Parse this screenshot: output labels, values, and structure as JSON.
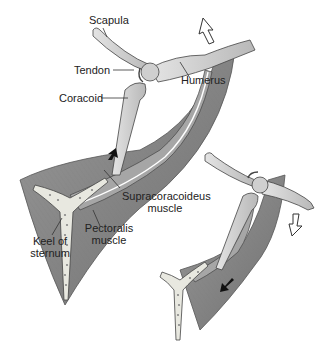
{
  "figure": {
    "panels": [
      {
        "id": "upstroke",
        "arrow_direction": "up",
        "labels": {
          "scapula": "Scapula",
          "tendon": "Tendon",
          "humerus": "Humerus",
          "coracoid": "Coracoid",
          "supracoracoideus_line1": "Supracoracoideus",
          "supracoracoideus_line2": "muscle",
          "pectoralis_line1": "Pectoralis",
          "pectoralis_line2": "muscle",
          "keel_line1": "Keel of",
          "keel_line2": "sternum"
        }
      },
      {
        "id": "downstroke",
        "arrow_direction": "down",
        "labels": {}
      }
    ],
    "colors": {
      "background": "#ffffff",
      "muscle": "#8c8c8c",
      "muscle_dark": "#6e6e6e",
      "bone": "#d4d4d4",
      "bone_outline": "#555555",
      "text": "#222222",
      "leader": "#333333",
      "motion_arrow": "#111111"
    }
  }
}
